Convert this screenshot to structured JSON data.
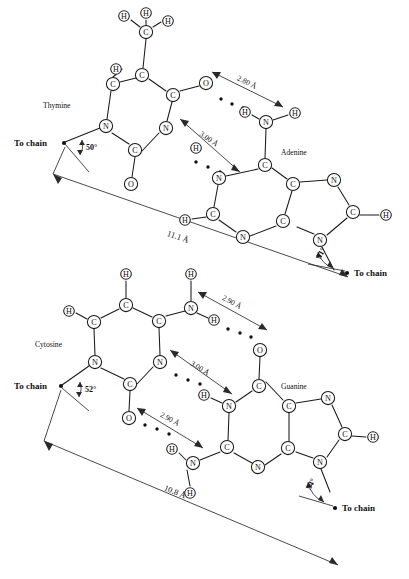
{
  "figure": {
    "background_color": "#ffffff",
    "ink_color": "#1a1a1a"
  },
  "pairs": [
    {
      "id": "thymine-adenine",
      "left_base_label": "Thymine",
      "right_base_label": "Adenine",
      "span_label": "11.1 Å",
      "left_angle_label": "50°",
      "right_angle_label": "51°",
      "left_chain_label": "To chain",
      "right_chain_label": "To chain",
      "hydrogen_bonds": [
        {
          "label": "2.80 Å",
          "donor": "N-H",
          "acceptor": "O"
        },
        {
          "label": "3.00 Å",
          "donor": "N-H",
          "acceptor": "N"
        }
      ],
      "atoms": [
        {
          "element": "H",
          "x": 124,
          "y": 16
        },
        {
          "element": "H",
          "x": 146,
          "y": 13
        },
        {
          "element": "H",
          "x": 168,
          "y": 21
        },
        {
          "element": "C",
          "x": 146,
          "y": 32
        },
        {
          "element": "C",
          "x": 142,
          "y": 75
        },
        {
          "element": "H",
          "x": 116,
          "y": 69
        },
        {
          "element": "C",
          "x": 113,
          "y": 84
        },
        {
          "element": "N",
          "x": 106,
          "y": 126
        },
        {
          "element": "C",
          "x": 135,
          "y": 150
        },
        {
          "element": "O",
          "x": 131,
          "y": 184
        },
        {
          "element": "N",
          "x": 166,
          "y": 128
        },
        {
          "element": "C",
          "x": 173,
          "y": 95
        },
        {
          "element": "O",
          "x": 206,
          "y": 83
        },
        {
          "element": "H",
          "x": 245,
          "y": 112
        },
        {
          "element": "N",
          "x": 266,
          "y": 122
        },
        {
          "element": "H",
          "x": 295,
          "y": 113
        },
        {
          "element": "C",
          "x": 265,
          "y": 165
        },
        {
          "element": "N",
          "x": 219,
          "y": 178
        },
        {
          "element": "H",
          "x": 196,
          "y": 148
        },
        {
          "element": "C",
          "x": 213,
          "y": 214
        },
        {
          "element": "H",
          "x": 185,
          "y": 220
        },
        {
          "element": "N",
          "x": 243,
          "y": 237
        },
        {
          "element": "C",
          "x": 283,
          "y": 221
        },
        {
          "element": "C",
          "x": 293,
          "y": 184
        },
        {
          "element": "N",
          "x": 334,
          "y": 180
        },
        {
          "element": "C",
          "x": 353,
          "y": 212
        },
        {
          "element": "H",
          "x": 386,
          "y": 215
        },
        {
          "element": "N",
          "x": 320,
          "y": 240
        }
      ]
    },
    {
      "id": "cytosine-guanine",
      "left_base_label": "Cytosine",
      "right_base_label": "Guanine",
      "span_label": "10.8 Å",
      "left_angle_label": "52°",
      "right_angle_label": "54°",
      "left_chain_label": "To chain",
      "right_chain_label": "To chain",
      "hydrogen_bonds": [
        {
          "label": "2.90 Å",
          "donor": "N-H",
          "acceptor": "O"
        },
        {
          "label": "3.00 Å",
          "donor": "N-H",
          "acceptor": "N"
        },
        {
          "label": "2.90 Å",
          "donor": "N-H",
          "acceptor": "O"
        }
      ],
      "atoms": [
        {
          "element": "H",
          "x": 126,
          "y": 274
        },
        {
          "element": "H",
          "x": 191,
          "y": 274
        },
        {
          "element": "C",
          "x": 126,
          "y": 305
        },
        {
          "element": "H",
          "x": 69,
          "y": 311
        },
        {
          "element": "C",
          "x": 94,
          "y": 322
        },
        {
          "element": "N",
          "x": 95,
          "y": 362
        },
        {
          "element": "C",
          "x": 130,
          "y": 384
        },
        {
          "element": "O",
          "x": 129,
          "y": 418
        },
        {
          "element": "N",
          "x": 160,
          "y": 362
        },
        {
          "element": "C",
          "x": 159,
          "y": 321
        },
        {
          "element": "N",
          "x": 191,
          "y": 308
        },
        {
          "element": "H",
          "x": 214,
          "y": 320
        },
        {
          "element": "O",
          "x": 260,
          "y": 350
        },
        {
          "element": "H",
          "x": 204,
          "y": 395
        },
        {
          "element": "N",
          "x": 229,
          "y": 406
        },
        {
          "element": "C",
          "x": 259,
          "y": 386
        },
        {
          "element": "C",
          "x": 227,
          "y": 447
        },
        {
          "element": "N",
          "x": 193,
          "y": 463
        },
        {
          "element": "H",
          "x": 172,
          "y": 449
        },
        {
          "element": "H",
          "x": 190,
          "y": 493
        },
        {
          "element": "N",
          "x": 258,
          "y": 467
        },
        {
          "element": "C",
          "x": 288,
          "y": 448
        },
        {
          "element": "C",
          "x": 289,
          "y": 406
        },
        {
          "element": "N",
          "x": 328,
          "y": 398
        },
        {
          "element": "C",
          "x": 345,
          "y": 434
        },
        {
          "element": "H",
          "x": 373,
          "y": 437
        },
        {
          "element": "N",
          "x": 320,
          "y": 462
        }
      ]
    }
  ]
}
